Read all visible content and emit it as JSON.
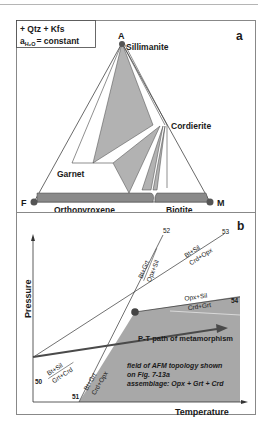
{
  "panel_a": {
    "letter": "a",
    "legend_line1": "+ Qtz + Kfs",
    "legend_line2_prefix": "a",
    "legend_line2_sub": "H₂O",
    "legend_line2_suffix": "= constant",
    "apex_labels": {
      "top": "A",
      "left": "F",
      "right": "M"
    },
    "phases": {
      "sillimanite": "Sillimanite",
      "cordierite": "Cordierite",
      "garnet": "Garnet",
      "orthopyroxene": "Orthopyroxene",
      "biotite": "Biotite"
    },
    "colors": {
      "tie_field": "#b2b2b2",
      "solid_solution_bar": "#8a8a8a",
      "point": "#555555",
      "line": "#444444"
    }
  },
  "panel_b": {
    "letter": "b",
    "y_axis_label": "Pressure",
    "x_axis_label": "Temperature",
    "reactions": [
      {
        "id": "50",
        "top": "Bt+Sil",
        "bottom": "Grt+Crd"
      },
      {
        "id": "51",
        "top": "Bt+Grt",
        "bottom": "Crd+Opx"
      },
      {
        "id": "52",
        "top": "Bt+Grt",
        "bottom": "Opx+Sil"
      },
      {
        "id": "53",
        "top": "Bt+Sil",
        "bottom": "Crd+Opx"
      },
      {
        "id": "54",
        "top": "Opx+Sil",
        "bottom": "Crd+Grt"
      }
    ],
    "pt_path_label": "P-T path of metamorphism",
    "field_note_line1": "field of AFM topology shown",
    "field_note_line2": "on Fig. 7-13a",
    "field_note_line3": "assemblage: Opx + Grt + Crd",
    "colors": {
      "field": "#a8a8a8",
      "path": "#4a4a4a",
      "invariant_point": "#444444"
    }
  }
}
